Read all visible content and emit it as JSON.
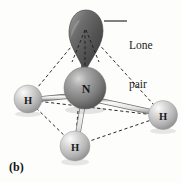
{
  "figure": {
    "panel_letter": "(b)",
    "background_color": "#fdfdfc",
    "width": 181,
    "height": 183
  },
  "callouts": [
    {
      "id": "lone-pair",
      "line1": "Lone",
      "line2": "pair",
      "leader_line_color": "#1b1b1b"
    }
  ],
  "atoms": [
    {
      "id": "nitrogen-center",
      "label": "N",
      "element": "N",
      "cx": 85,
      "cy": 88,
      "r": 21,
      "fill_color": "#8a8a8a",
      "highlight_color": "#cfcfcf",
      "font_size": 12
    },
    {
      "id": "hydrogen-left",
      "label": "H",
      "element": "H",
      "cx": 28,
      "cy": 99,
      "r": 14,
      "fill_color": "#c8c8c8",
      "highlight_color": "#f2f2f2",
      "font_size": 10.5
    },
    {
      "id": "hydrogen-right",
      "label": "H",
      "element": "H",
      "cx": 163,
      "cy": 115,
      "r": 14.5,
      "fill_color": "#c8c8c8",
      "highlight_color": "#f2f2f2",
      "font_size": 10.5
    },
    {
      "id": "hydrogen-bottom",
      "label": "H",
      "element": "H",
      "cx": 75,
      "cy": 146,
      "r": 15,
      "fill_color": "#c8c8c8",
      "highlight_color": "#f2f2f2",
      "font_size": 10.5
    }
  ],
  "lone_pair_lobe": {
    "id": "lone-pair-lobe",
    "apex_x": 85,
    "apex_y": 72,
    "top_y": 10,
    "fill_color": "#585858",
    "highlight_color": "#9a9a9a",
    "shade_color": "#3d3d3d"
  },
  "bonds": [
    {
      "id": "bond-n-h-left",
      "from": "nitrogen-center",
      "to": "hydrogen-left",
      "style": "tube",
      "color": "#e8e8e8",
      "edge_color": "#6f6f6f"
    },
    {
      "id": "bond-n-h-right",
      "from": "nitrogen-center",
      "to": "hydrogen-right",
      "style": "tube",
      "color": "#e8e8e8",
      "edge_color": "#6f6f6f"
    },
    {
      "id": "bond-n-h-bottom",
      "from": "nitrogen-center",
      "to": "hydrogen-bottom",
      "style": "tube",
      "color": "#e8e8e8",
      "edge_color": "#6f6f6f"
    }
  ],
  "geometry_edges": [
    {
      "id": "edge-lonepair-hleft",
      "style": "dashed",
      "color": "#2a2a2a"
    },
    {
      "id": "edge-lonepair-hright",
      "style": "dashed",
      "color": "#2a2a2a"
    },
    {
      "id": "edge-lonepair-hbottom",
      "style": "dashed",
      "color": "#2a2a2a"
    },
    {
      "id": "edge-hleft-hright",
      "style": "dashed",
      "color": "#2a2a2a"
    },
    {
      "id": "edge-hleft-hbottom",
      "style": "dashed",
      "color": "#2a2a2a"
    },
    {
      "id": "edge-hbottom-hright",
      "style": "dashed",
      "color": "#2a2a2a"
    }
  ]
}
